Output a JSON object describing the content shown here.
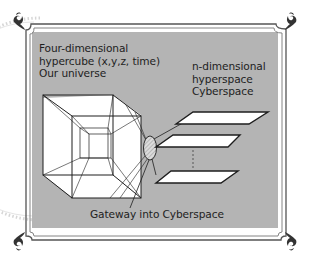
{
  "figure": {
    "left_label": {
      "lines": [
        "Four-dimensional",
        "hypercube (x,y,z, time)",
        "Our universe"
      ]
    },
    "right_label": {
      "lines": [
        "n-dimensional",
        "hyperspace",
        "Cyberspace"
      ]
    },
    "bottom_label": "Gateway into Cyberspace",
    "ellipsis": "⋮",
    "colors": {
      "panel_gray": "#b4b4b4",
      "frame_line": "#555555",
      "ink": "#1e1e1e",
      "plane_fill": "#ffffff",
      "gateway_fill": "#d8d8d8"
    }
  }
}
